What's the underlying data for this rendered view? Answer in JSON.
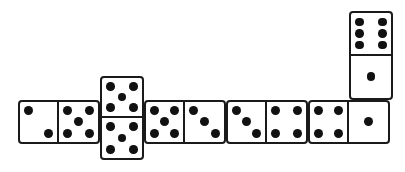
{
  "scene": {
    "title": "Domino chain layout",
    "background_color": "#ffffff",
    "tile_face_color": "#ffffff",
    "tile_border_color": "#1a1a1a",
    "pip_color": "#111111",
    "tile_count": 6
  },
  "chart_data": {
    "type": "diagram",
    "xlabel": "",
    "ylabel": "",
    "categories": [
      "tile-1",
      "tile-2",
      "tile-3",
      "tile-4",
      "tile-5",
      "tile-6"
    ],
    "values": [
      7,
      10,
      8,
      7,
      5,
      7
    ],
    "series": [
      {
        "name": "left-or-top-pips",
        "values": [
          2,
          5,
          5,
          3,
          4,
          6
        ]
      },
      {
        "name": "right-or-bottom-pips",
        "values": [
          5,
          5,
          3,
          4,
          1,
          1
        ]
      }
    ],
    "annotations": [
      "chain reads 2-5, 5-5, 5-3, 3-4, 4-1, 1-6",
      "two tiles placed vertically: the 5-5 double and the end 1-6"
    ]
  },
  "tiles": [
    {
      "id": "tile-1",
      "name": "domino-2-5",
      "orientation": "horizontal",
      "values": [
        2,
        5
      ],
      "label": "2 | 5",
      "x": 18,
      "y": 100,
      "w": 82,
      "h": 44
    },
    {
      "id": "tile-2",
      "name": "domino-5-5",
      "orientation": "vertical",
      "values": [
        5,
        5
      ],
      "label": "5 | 5",
      "x": 100,
      "y": 76,
      "w": 44,
      "h": 84
    },
    {
      "id": "tile-3",
      "name": "domino-5-3",
      "orientation": "horizontal",
      "values": [
        5,
        3
      ],
      "label": "5 | 3",
      "x": 144,
      "y": 100,
      "w": 82,
      "h": 44
    },
    {
      "id": "tile-4",
      "name": "domino-3-4",
      "orientation": "horizontal",
      "values": [
        3,
        4
      ],
      "label": "3 | 4",
      "x": 226,
      "y": 100,
      "w": 82,
      "h": 44
    },
    {
      "id": "tile-5",
      "name": "domino-4-1",
      "orientation": "horizontal",
      "values": [
        4,
        1
      ],
      "label": "4 | 1",
      "x": 308,
      "y": 100,
      "w": 82,
      "h": 44
    },
    {
      "id": "tile-6",
      "name": "domino-6-1",
      "orientation": "vertical",
      "values": [
        6,
        1
      ],
      "label": "6 | 1",
      "x": 349,
      "y": 11,
      "w": 44,
      "h": 89
    }
  ],
  "pip_layouts": {
    "0": [],
    "1": [
      4
    ],
    "2": [
      0,
      8
    ],
    "3": [
      0,
      4,
      8
    ],
    "4": [
      0,
      2,
      6,
      8
    ],
    "5": [
      0,
      2,
      4,
      6,
      8
    ],
    "6": [
      0,
      2,
      3,
      5,
      6,
      8
    ]
  }
}
